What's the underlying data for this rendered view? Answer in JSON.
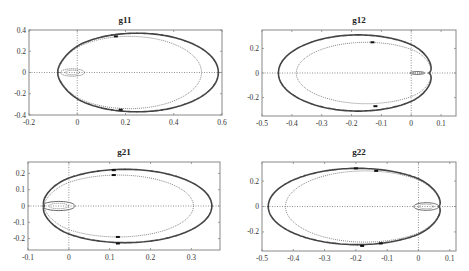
{
  "figure": {
    "width": 469,
    "height": 271,
    "background": "#ffffff",
    "axes_color": "#888888",
    "curve_color": "#444444",
    "inner_curve_color": "#666666",
    "grid_color": "#777777"
  },
  "chart_data": [
    {
      "type": "line",
      "title": "g11",
      "box": {
        "left": 29,
        "top": 30,
        "right": 222,
        "bottom": 115
      },
      "xlim": [
        -0.2,
        0.6
      ],
      "ylim": [
        -0.4,
        0.4
      ],
      "xticks": [
        -0.2,
        0,
        0.2,
        0.4,
        0.6
      ],
      "xticklabels": [
        "-0.2",
        "0",
        "0.2",
        "0.4",
        "0.6"
      ],
      "yticks": [
        -0.4,
        -0.2,
        0,
        0.2,
        0.4
      ],
      "yticklabels": [
        "-0.4",
        "-0.2",
        "0",
        "0.2",
        "0.4"
      ],
      "xlabel": "",
      "ylabel": "",
      "grid": "zero-lines only (dotted)",
      "series": [
        {
          "name": "outer envelope",
          "kind": "cardioid",
          "xmin": -0.09,
          "xmax": 0.585,
          "ymax": 0.37,
          "cusp_x": -0.08,
          "style": "solid-thick"
        },
        {
          "name": "inner nominal",
          "kind": "cardioid",
          "xmin": -0.085,
          "xmax": 0.515,
          "ymax": 0.34,
          "cusp_x": -0.08,
          "style": "dotted"
        },
        {
          "name": "small loop",
          "kind": "loop",
          "cx": -0.02,
          "rx": 0.05,
          "ry": 0.035,
          "style": "dotted"
        }
      ],
      "markers": [
        {
          "x": 0.16,
          "y": 0.34
        },
        {
          "x": 0.18,
          "y": -0.35
        }
      ]
    },
    {
      "type": "line",
      "title": "g12",
      "box": {
        "left": 262,
        "top": 30,
        "right": 456,
        "bottom": 116
      },
      "xlim": [
        -0.5,
        0.15
      ],
      "ylim": [
        -0.35,
        0.35
      ],
      "xticks": [
        -0.5,
        -0.4,
        -0.3,
        -0.2,
        -0.1,
        0,
        0.1
      ],
      "xticklabels": [
        "-0.5",
        "-0.4",
        "-0.3",
        "-0.2",
        "-0.1",
        "0",
        "0.1"
      ],
      "yticks": [
        -0.2,
        0,
        0.2
      ],
      "yticklabels": [
        "-0.2",
        "0",
        "0.2"
      ],
      "xlabel": "",
      "ylabel": "",
      "grid": "zero-lines only (dotted)",
      "series": [
        {
          "name": "outer envelope",
          "kind": "cardioid-mirrored",
          "xmin": -0.445,
          "xmax": 0.09,
          "ymax": 0.31,
          "cusp_x": 0.06,
          "style": "solid-thick"
        },
        {
          "name": "inner nominal",
          "kind": "cardioid-mirrored",
          "xmin": -0.385,
          "xmax": 0.085,
          "ymax": 0.25,
          "cusp_x": 0.06,
          "style": "dotted"
        },
        {
          "name": "small loop",
          "kind": "loop",
          "cx": 0.02,
          "rx": 0.025,
          "ry": 0.012,
          "style": "solid"
        }
      ],
      "markers": [
        {
          "x": -0.13,
          "y": 0.25
        },
        {
          "x": -0.12,
          "y": -0.27
        }
      ]
    },
    {
      "type": "line",
      "title": "g21",
      "box": {
        "left": 28,
        "top": 162,
        "right": 220,
        "bottom": 250
      },
      "xlim": [
        -0.1,
        0.37
      ],
      "ylim": [
        -0.27,
        0.27
      ],
      "xticks": [
        -0.1,
        0,
        0.1,
        0.2,
        0.3
      ],
      "xticklabels": [
        "-0.1",
        "0",
        "0.1",
        "0.2",
        "0.3"
      ],
      "yticks": [
        -0.2,
        -0.1,
        0,
        0.1,
        0.2
      ],
      "yticklabels": [
        "-0.2",
        "-0.1",
        "0",
        "0.1",
        "0.2"
      ],
      "xlabel": "",
      "ylabel": "",
      "grid": "zero-lines only (dotted)",
      "series": [
        {
          "name": "outer envelope",
          "kind": "cardioid",
          "xmin": -0.075,
          "xmax": 0.35,
          "ymax": 0.225,
          "cusp_x": -0.06,
          "style": "solid-thick"
        },
        {
          "name": "inner nominal",
          "kind": "cardioid",
          "xmin": -0.065,
          "xmax": 0.305,
          "ymax": 0.19,
          "cusp_x": -0.06,
          "style": "dotted"
        },
        {
          "name": "small loop",
          "kind": "loop",
          "cx": -0.025,
          "rx": 0.04,
          "ry": 0.028,
          "style": "solid"
        }
      ],
      "markers": [
        {
          "x": 0.11,
          "y": 0.19
        },
        {
          "x": 0.12,
          "y": -0.19
        },
        {
          "x": 0.11,
          "y": 0.22
        },
        {
          "x": 0.12,
          "y": -0.23
        }
      ]
    },
    {
      "type": "line",
      "title": "g22",
      "box": {
        "left": 262,
        "top": 162,
        "right": 456,
        "bottom": 251
      },
      "xlim": [
        -0.5,
        0.12
      ],
      "ylim": [
        -0.35,
        0.35
      ],
      "xticks": [
        -0.5,
        -0.4,
        -0.3,
        -0.2,
        -0.1,
        0,
        0.1
      ],
      "xticklabels": [
        "-0.5",
        "-0.4",
        "-0.3",
        "-0.2",
        "-0.1",
        "0",
        "0.1"
      ],
      "yticks": [
        -0.2,
        0,
        0.2
      ],
      "yticklabels": [
        "-0.2",
        "0",
        "0.2"
      ],
      "xlabel": "",
      "ylabel": "",
      "grid": "zero-lines only (dotted)",
      "series": [
        {
          "name": "outer envelope",
          "kind": "cardioid-mirrored",
          "xmin": -0.48,
          "xmax": 0.09,
          "ymax": 0.3,
          "cusp_x": 0.065,
          "style": "solid-thick"
        },
        {
          "name": "inner nominal",
          "kind": "cardioid-mirrored",
          "xmin": -0.425,
          "xmax": 0.085,
          "ymax": 0.28,
          "cusp_x": 0.065,
          "style": "dotted"
        },
        {
          "name": "small loop",
          "kind": "loop",
          "cx": 0.025,
          "rx": 0.04,
          "ry": 0.03,
          "style": "solid"
        }
      ],
      "markers": [
        {
          "x": -0.2,
          "y": 0.3
        },
        {
          "x": -0.135,
          "y": 0.28
        },
        {
          "x": -0.12,
          "y": -0.29
        },
        {
          "x": -0.18,
          "y": -0.31
        }
      ]
    }
  ]
}
